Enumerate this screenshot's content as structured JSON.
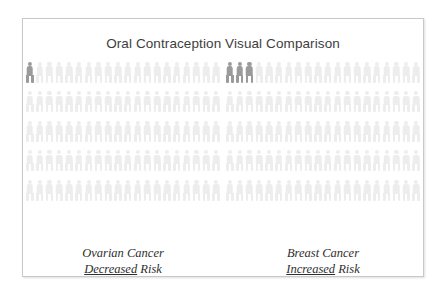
{
  "figure": {
    "title": "Oral Contraception Visual Comparison",
    "border_color": "#c8c8c8",
    "background_color": "#ffffff"
  },
  "legend_colors": {
    "base_figure": "#ededed",
    "accent_figure": "#9b9b9b"
  },
  "groups": [
    {
      "id": "ovarian",
      "label_line1": "Ovarian Cancer",
      "label_emphasis": "Decreased",
      "label_suffix": " Risk",
      "highlighted": 1,
      "total": 100
    },
    {
      "id": "breast",
      "label_line1": "Breast Cancer",
      "label_emphasis": "Increased",
      "label_suffix": " Risk",
      "highlighted": 3,
      "total": 100
    }
  ],
  "chart_data": {
    "type": "pictogram",
    "title": "Oral Contraception Visual Comparison",
    "xlabel": "",
    "ylabel": "",
    "unit": "1 icon = 1 woman out of 100",
    "grid": {
      "columns": 20,
      "rows": 5,
      "icons_per_group": 100
    },
    "legend": [
      {
        "name": "Affected",
        "color": "#9b9b9b"
      },
      {
        "name": "Unaffected",
        "color": "#ededed"
      }
    ],
    "categories": [
      "Ovarian Cancer (Decreased Risk)",
      "Breast Cancer (Increased Risk)"
    ],
    "values": [
      1,
      3
    ],
    "series": [
      {
        "name": "Affected per 100",
        "values": [
          1,
          3
        ]
      },
      {
        "name": "Unaffected per 100",
        "values": [
          99,
          97
        ]
      }
    ],
    "annotations": [
      "Ovarian Cancer — Decreased Risk",
      "Breast Cancer — Increased Risk"
    ]
  }
}
